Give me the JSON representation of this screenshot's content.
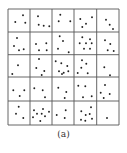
{
  "figure": {
    "caption": "(a)",
    "colors": {
      "line": "#555555",
      "dot": "#222222",
      "background": "#ffffff"
    },
    "grid": {
      "rows": 5,
      "cols": 5,
      "x_lines": [
        8,
        30,
        52,
        74,
        96.7,
        119
      ],
      "y_lines": [
        9,
        32,
        54.7,
        77,
        101,
        125
      ]
    },
    "cells": [
      {
        "row": 0,
        "col": 0,
        "count": 3,
        "dots": [
          [
            23,
            15.3
          ],
          [
            15.3,
            22
          ],
          [
            25.3,
            22.7
          ]
        ]
      },
      {
        "row": 0,
        "col": 1,
        "count": 4,
        "dots": [
          [
            38,
            16.3
          ],
          [
            38.7,
            24.7
          ],
          [
            43.7,
            25.7
          ],
          [
            49.3,
            26.3
          ]
        ]
      },
      {
        "row": 0,
        "col": 2,
        "count": 3,
        "dots": [
          [
            60.3,
            14.7
          ],
          [
            58.7,
            21.3
          ],
          [
            70.3,
            21.3
          ]
        ]
      },
      {
        "row": 0,
        "col": 3,
        "count": 4,
        "dots": [
          [
            92,
            17.3
          ],
          [
            80.3,
            19
          ],
          [
            86,
            23.7
          ],
          [
            82.3,
            27
          ]
        ]
      },
      {
        "row": 0,
        "col": 4,
        "count": 3,
        "dots": [
          [
            106,
            19.7
          ],
          [
            109.7,
            24.7
          ],
          [
            113,
            29
          ]
        ]
      },
      {
        "row": 1,
        "col": 0,
        "count": 4,
        "dots": [
          [
            17,
            38
          ],
          [
            14,
            46
          ],
          [
            19,
            50.3
          ],
          [
            23.7,
            49.3
          ]
        ]
      },
      {
        "row": 1,
        "col": 1,
        "count": 4,
        "dots": [
          [
            36,
            44
          ],
          [
            46.3,
            43.3
          ],
          [
            39,
            50.3
          ],
          [
            46.7,
            50.3
          ]
        ]
      },
      {
        "row": 1,
        "col": 2,
        "count": 4,
        "dots": [
          [
            59.7,
            36.3
          ],
          [
            63,
            41
          ],
          [
            58,
            48.7
          ],
          [
            68.7,
            52.3
          ]
        ]
      },
      {
        "row": 1,
        "col": 3,
        "count": 7,
        "dots": [
          [
            82.3,
            37.3
          ],
          [
            90,
            39.3
          ],
          [
            79.7,
            43.3
          ],
          [
            86,
            43.3
          ],
          [
            91.7,
            43.3
          ],
          [
            84,
            48.7
          ],
          [
            90,
            48.7
          ]
        ]
      },
      {
        "row": 1,
        "col": 4,
        "count": 4,
        "dots": [
          [
            105,
            40.3
          ],
          [
            110.3,
            44
          ],
          [
            107.7,
            50.3
          ],
          [
            113.7,
            51
          ]
        ]
      },
      {
        "row": 2,
        "col": 0,
        "count": 2,
        "dots": [
          [
            18,
            65.3
          ],
          [
            12.3,
            74
          ]
        ]
      },
      {
        "row": 2,
        "col": 1,
        "count": 4,
        "dots": [
          [
            39,
            59
          ],
          [
            36.3,
            68
          ],
          [
            44.3,
            71
          ],
          [
            41.7,
            75
          ]
        ]
      },
      {
        "row": 2,
        "col": 2,
        "count": 7,
        "dots": [
          [
            55.7,
            61.3
          ],
          [
            61.3,
            63.3
          ],
          [
            67.3,
            66
          ],
          [
            59,
            71.3
          ],
          [
            63.7,
            72.7
          ],
          [
            68.3,
            71.3
          ],
          [
            62,
            74
          ]
        ]
      },
      {
        "row": 2,
        "col": 3,
        "count": 5,
        "dots": [
          [
            82,
            60.3
          ],
          [
            86.3,
            63.7
          ],
          [
            81.3,
            67.7
          ],
          [
            77.7,
            73
          ],
          [
            87.7,
            73.3
          ]
        ]
      },
      {
        "row": 2,
        "col": 4,
        "count": 2,
        "dots": [
          [
            104.3,
            67.3
          ],
          [
            110,
            75.3
          ]
        ]
      },
      {
        "row": 3,
        "col": 0,
        "count": 3,
        "dots": [
          [
            13.3,
            90.3
          ],
          [
            24.3,
            90.3
          ],
          [
            19.7,
            96
          ]
        ]
      },
      {
        "row": 3,
        "col": 1,
        "count": 3,
        "dots": [
          [
            34.3,
            88.3
          ],
          [
            42.7,
            90.3
          ],
          [
            45,
            97.3
          ]
        ]
      },
      {
        "row": 3,
        "col": 2,
        "count": 3,
        "dots": [
          [
            58.3,
            87.7
          ],
          [
            66.3,
            92
          ],
          [
            64.7,
            98
          ]
        ]
      },
      {
        "row": 3,
        "col": 3,
        "count": 4,
        "dots": [
          [
            78.3,
            85.7
          ],
          [
            85.3,
            86.3
          ],
          [
            91.7,
            96.3
          ],
          [
            83,
            97.3
          ]
        ]
      },
      {
        "row": 3,
        "col": 4,
        "count": 4,
        "dots": [
          [
            105,
            85
          ],
          [
            100.7,
            92.7
          ],
          [
            103.7,
            98
          ],
          [
            109.7,
            94
          ]
        ]
      },
      {
        "row": 4,
        "col": 0,
        "count": 3,
        "dots": [
          [
            18.7,
            106.7
          ],
          [
            16,
            113.7
          ],
          [
            23.3,
            118
          ]
        ]
      },
      {
        "row": 4,
        "col": 1,
        "count": 8,
        "dots": [
          [
            34,
            110.3
          ],
          [
            43,
            109
          ],
          [
            49,
            111.7
          ],
          [
            37,
            113.7
          ],
          [
            41.7,
            113.7
          ],
          [
            45,
            116.3
          ],
          [
            33,
            117.3
          ],
          [
            40.3,
            121
          ]
        ]
      },
      {
        "row": 4,
        "col": 2,
        "count": 3,
        "dots": [
          [
            65.7,
            110.3
          ],
          [
            56.7,
            115
          ],
          [
            64.7,
            118
          ]
        ]
      },
      {
        "row": 4,
        "col": 3,
        "count": 7,
        "dots": [
          [
            91,
            107.3
          ],
          [
            81.3,
            111.3
          ],
          [
            89.7,
            114
          ],
          [
            85.7,
            115
          ],
          [
            81,
            119.7
          ],
          [
            85.3,
            120.7
          ],
          [
            92,
            118.7
          ]
        ]
      },
      {
        "row": 4,
        "col": 4,
        "count": 1,
        "dots": [
          [
            107,
            118
          ]
        ]
      }
    ]
  }
}
